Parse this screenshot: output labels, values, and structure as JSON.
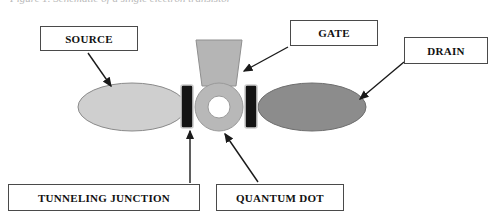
{
  "figure": {
    "background_color": "#ffffff",
    "clipped_caption_text": "Figure 1.  Schematic of a single electron transistor"
  },
  "labels": {
    "source": "SOURCE",
    "gate": "GATE",
    "drain": "DRAIN",
    "tunneling_junction": "TUNNELING JUNCTION",
    "quantum_dot": "QUANTUM DOT"
  },
  "shapes": {
    "source_electrode": {
      "name": "source-ellipse",
      "fill": "#cfcfcf",
      "stroke": "#8a8a8a",
      "cx": 132,
      "cy": 107,
      "rx": 54,
      "ry": 24
    },
    "drain_electrode": {
      "name": "drain-ellipse",
      "fill": "#8c8c8c",
      "stroke": "#6e6e6e",
      "cx": 312,
      "cy": 107,
      "rx": 54,
      "ry": 24
    },
    "gate_electrode": {
      "name": "gate-trapezoid",
      "fill": "#b5b5b5",
      "stroke": "#8f8f8f",
      "top_width": 46,
      "bottom_width": 34,
      "top_y": 40,
      "bottom_y": 86
    },
    "left_barrier": {
      "name": "left-tunneling-barrier",
      "fill": "#141414",
      "stroke": "#cccccc",
      "x": 181,
      "y": 85,
      "width": 12,
      "height": 43
    },
    "right_barrier": {
      "name": "right-tunneling-barrier",
      "fill": "#141414",
      "stroke": "#cccccc",
      "x": 245,
      "y": 85,
      "width": 12,
      "height": 43
    },
    "quantum_dot": {
      "name": "quantum-dot-annulus",
      "fill": "#b8b8b8",
      "stroke": "#9a9a9a",
      "hole_fill": "#ffffff",
      "cx": 219,
      "cy": 107,
      "outer_rx": 24,
      "outer_ry": 24,
      "inner_rx": 11,
      "inner_ry": 11
    }
  },
  "arrows": {
    "stroke_color": "#1a1a1a",
    "stroke_width": 1.4,
    "source_to_electrode": {
      "x1": 88,
      "y1": 53,
      "x2": 111,
      "y2": 86
    },
    "gate_to_electrode": {
      "x1": 288,
      "y1": 47,
      "x2": 244,
      "y2": 71
    },
    "drain_to_electrode": {
      "x1": 404,
      "y1": 62,
      "x2": 360,
      "y2": 99
    },
    "tunnel_to_barrier": {
      "x1": 190,
      "y1": 183,
      "x2": 190,
      "y2": 131
    },
    "qdot_to_dot": {
      "x1": 258,
      "y1": 182,
      "x2": 225,
      "y2": 134
    }
  }
}
